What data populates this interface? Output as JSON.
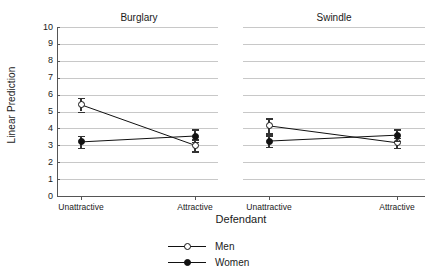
{
  "chart_data": {
    "type": "line",
    "title": "",
    "xlabel": "Defendant",
    "ylabel": "Linear Prediction",
    "ylim": [
      0,
      10
    ],
    "yticks": [
      0,
      1,
      2,
      3,
      4,
      5,
      6,
      7,
      8,
      9,
      10
    ],
    "categories": [
      "Unattractive",
      "Attractive"
    ],
    "grid": true,
    "legend_position": "bottom-center",
    "panels": [
      {
        "title": "Burglary",
        "series": [
          {
            "name": "Men",
            "marker": "open-circle",
            "color": "#111111",
            "values": [
              5.4,
              3.0
            ],
            "err_low": [
              5.0,
              2.65
            ],
            "err_high": [
              5.8,
              3.35
            ]
          },
          {
            "name": "Women",
            "marker": "filled-circle",
            "color": "#111111",
            "values": [
              3.2,
              3.55
            ],
            "err_low": [
              2.85,
              3.2
            ],
            "err_high": [
              3.55,
              3.95
            ]
          }
        ]
      },
      {
        "title": "Swindle",
        "series": [
          {
            "name": "Men",
            "marker": "open-circle",
            "color": "#111111",
            "values": [
              4.15,
              3.15
            ],
            "err_low": [
              3.7,
              2.85
            ],
            "err_high": [
              4.6,
              3.45
            ]
          },
          {
            "name": "Women",
            "marker": "filled-circle",
            "color": "#111111",
            "values": [
              3.25,
              3.6
            ],
            "err_low": [
              2.9,
              3.25
            ],
            "err_high": [
              3.6,
              3.95
            ]
          }
        ]
      }
    ],
    "legend": [
      {
        "label": "Men",
        "marker": "open-circle"
      },
      {
        "label": "Women",
        "marker": "filled-circle"
      }
    ]
  }
}
